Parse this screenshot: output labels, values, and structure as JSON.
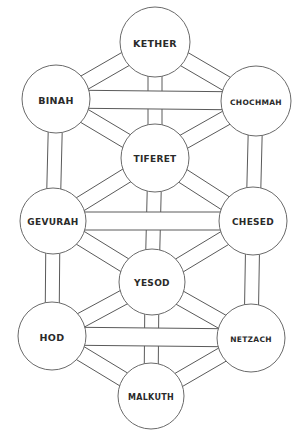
{
  "diagram": {
    "title": "Tree of Life",
    "colors": {
      "background": "#ffffff",
      "line": "#5a5a5a",
      "circle_fill": "#ffffff",
      "label": "#2a2a2a"
    },
    "sephirot": [
      {
        "id": "kether",
        "label": "KETHER",
        "cx": 155,
        "cy": 42,
        "r": 35,
        "font_size": 9.5
      },
      {
        "id": "binah",
        "label": "BINAH",
        "cx": 56,
        "cy": 99,
        "r": 34,
        "font_size": 9.5
      },
      {
        "id": "chochmah",
        "label": "CHOCHMAH",
        "cx": 256,
        "cy": 101,
        "r": 35,
        "font_size": 7.5
      },
      {
        "id": "tiferet",
        "label": "TIFERET",
        "cx": 155,
        "cy": 158,
        "r": 34,
        "font_size": 9
      },
      {
        "id": "gevurah",
        "label": "GEVURAH",
        "cx": 53,
        "cy": 221,
        "r": 33,
        "font_size": 9
      },
      {
        "id": "chesed",
        "label": "CHESED",
        "cx": 253,
        "cy": 221,
        "r": 34,
        "font_size": 9
      },
      {
        "id": "yesod",
        "label": "YESOD",
        "cx": 152,
        "cy": 282,
        "r": 33,
        "font_size": 9
      },
      {
        "id": "hod",
        "label": "HOD",
        "cx": 52,
        "cy": 336,
        "r": 34,
        "font_size": 9.5
      },
      {
        "id": "netzach",
        "label": "NETZACH",
        "cx": 251,
        "cy": 338,
        "r": 34,
        "font_size": 7.5
      },
      {
        "id": "malkuth",
        "label": "MALKUTH",
        "cx": 151,
        "cy": 396,
        "r": 33,
        "font_size": 8
      }
    ],
    "paths": [
      {
        "from": "kether",
        "to": "tiferet",
        "width": 14
      },
      {
        "from": "tiferet",
        "to": "yesod",
        "width": 14
      },
      {
        "from": "yesod",
        "to": "malkuth",
        "width": 14
      },
      {
        "from": "binah",
        "to": "gevurah",
        "width": 14
      },
      {
        "from": "gevurah",
        "to": "hod",
        "width": 14
      },
      {
        "from": "chochmah",
        "to": "chesed",
        "width": 14
      },
      {
        "from": "chesed",
        "to": "netzach",
        "width": 14
      },
      {
        "from": "kether",
        "to": "binah",
        "width": 15
      },
      {
        "from": "kether",
        "to": "chochmah",
        "width": 15
      },
      {
        "from": "binah",
        "to": "tiferet",
        "width": 15
      },
      {
        "from": "chochmah",
        "to": "tiferet",
        "width": 15
      },
      {
        "from": "tiferet",
        "to": "gevurah",
        "width": 15
      },
      {
        "from": "tiferet",
        "to": "chesed",
        "width": 15
      },
      {
        "from": "gevurah",
        "to": "yesod",
        "width": 15
      },
      {
        "from": "chesed",
        "to": "yesod",
        "width": 15
      },
      {
        "from": "yesod",
        "to": "hod",
        "width": 15
      },
      {
        "from": "yesod",
        "to": "netzach",
        "width": 15
      },
      {
        "from": "hod",
        "to": "malkuth",
        "width": 15
      },
      {
        "from": "netzach",
        "to": "malkuth",
        "width": 15
      },
      {
        "from": "binah",
        "to": "chochmah",
        "width": 18
      },
      {
        "from": "gevurah",
        "to": "chesed",
        "width": 18
      },
      {
        "from": "hod",
        "to": "netzach",
        "width": 18
      }
    ]
  }
}
